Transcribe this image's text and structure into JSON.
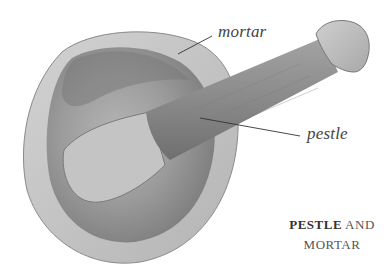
{
  "figure": {
    "labels": {
      "mortar": "mortar",
      "pestle": "pestle"
    },
    "caption": {
      "bold_part": "PESTLE",
      "rest_line1": " AND",
      "line2": "MORTAR"
    },
    "colors": {
      "background": "#ffffff",
      "mortar_rim": "#c9c9c9",
      "mortar_bowl": "#9a9a9a",
      "pestle_wood": "#8f8f8f",
      "label_text": "#444444",
      "leader_line": "#333333"
    }
  }
}
